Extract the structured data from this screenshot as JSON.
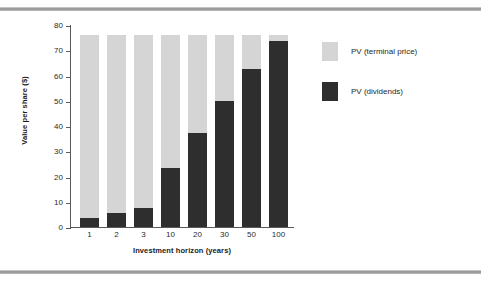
{
  "chart_data": {
    "type": "bar",
    "subtype": "stacked-bar",
    "title": "",
    "xlabel": "Investment horizon (years)",
    "ylabel": "Value per share ($)",
    "categories": [
      "1",
      "2",
      "3",
      "10",
      "20",
      "30",
      "50",
      "100"
    ],
    "ylim": [
      0,
      80
    ],
    "yticks": [
      0,
      10,
      20,
      30,
      40,
      50,
      60,
      70,
      80
    ],
    "ytick_labels": [
      "0",
      "10",
      "20",
      "30",
      "40",
      "50",
      "60",
      "70",
      "80"
    ],
    "grid": false,
    "legend_position": "right",
    "series": [
      {
        "name": "PV (dividends)",
        "color": "#2e2e2e",
        "values": [
          3.5,
          5.5,
          7.5,
          23.2,
          37.4,
          49.8,
          62.6,
          73.7
        ]
      },
      {
        "name": "PV (terminal price)",
        "color": "#d5d5d5",
        "values": [
          72.5,
          70.5,
          68.5,
          52.8,
          38.6,
          26.2,
          13.4,
          2.3
        ]
      }
    ],
    "stack_total": 76.0
  },
  "legend": {
    "items": [
      {
        "label": "PV (terminal price)",
        "color": "#d5d5d5"
      },
      {
        "label": "PV (dividends)",
        "color": "#2e2e2e"
      }
    ]
  },
  "colors": {
    "terminal_price": "#d5d5d5",
    "dividends": "#2e2e2e",
    "axis": "#5a5a5a",
    "text": "#1f1f1f",
    "rule": "#8e8e8e"
  }
}
